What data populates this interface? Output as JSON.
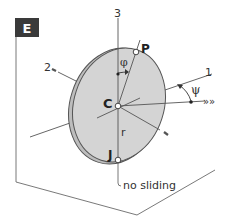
{
  "figure": {
    "panel_label": "E",
    "colors": {
      "panel_bg": "#3a3a3a",
      "panel_text": "#ffffff",
      "disk_fill": "#d4d4d4",
      "line": "#555555",
      "text": "#333333"
    },
    "axes": {
      "axis_1": "1",
      "axis_2": "2",
      "axis_3": "3"
    },
    "points": {
      "contact_point": "J",
      "center": "C",
      "rim_point": "P"
    },
    "angles": {
      "phi": "φ",
      "psi": "ψ"
    },
    "radius_label": "r",
    "direction_marker": "»»",
    "annotation": "no sliding"
  }
}
